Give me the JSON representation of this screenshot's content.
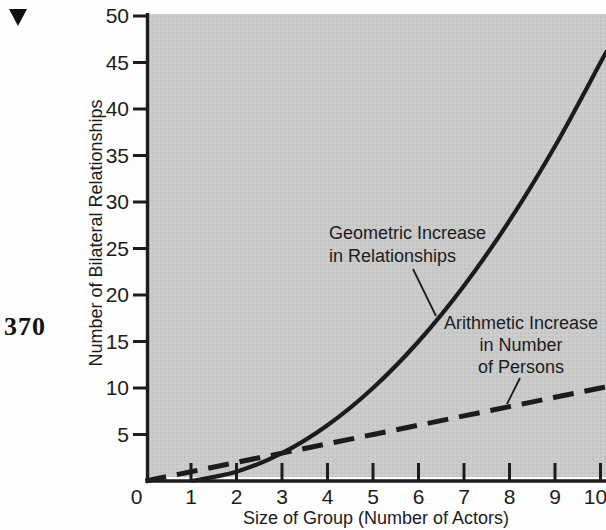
{
  "page": {
    "number": "370",
    "marker_icon": "down-triangle-icon"
  },
  "colors": {
    "ink": "#1c1c1c",
    "panel_gray": "#cbcbcb",
    "panel_dot": "#b9b9b9",
    "paper": "#fdfdfd"
  },
  "chart_data": {
    "type": "line",
    "title": "",
    "xlabel": "Size of Group (Number of Actors)",
    "ylabel": "Number of Bilateral Relationships",
    "xlim": [
      0,
      10
    ],
    "ylim": [
      0,
      50
    ],
    "grid": false,
    "legend_position": "none",
    "x_ticks": [
      0,
      1,
      2,
      3,
      4,
      5,
      6,
      7,
      8,
      9,
      10
    ],
    "y_ticks": [
      5,
      10,
      15,
      20,
      25,
      30,
      35,
      40,
      45,
      50
    ],
    "series": [
      {
        "name": "Geometric Increase in Relationships",
        "style": "solid",
        "x": [
          1,
          2,
          3,
          4,
          5,
          6,
          7,
          8,
          9,
          10
        ],
        "y": [
          0,
          1,
          3,
          6,
          10,
          15,
          21,
          28,
          36,
          45
        ]
      },
      {
        "name": "Arithmetic Increase in Number of Persons",
        "style": "dashed",
        "x": [
          0,
          1,
          2,
          3,
          4,
          5,
          6,
          7,
          8,
          9,
          10
        ],
        "y": [
          0,
          1,
          2,
          3,
          4,
          5,
          6,
          7,
          8,
          9,
          10
        ]
      }
    ],
    "annotations": [
      {
        "lines": [
          "Geometric Increase",
          "in Relationships"
        ],
        "align": "left"
      },
      {
        "lines": [
          "Arithmetic Increase",
          "in Number",
          "of Persons"
        ],
        "align": "center"
      }
    ]
  }
}
